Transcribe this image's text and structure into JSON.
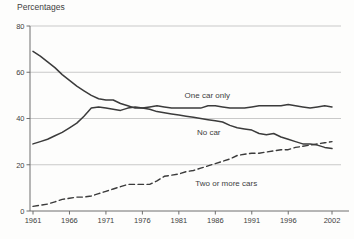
{
  "chart_data": {
    "type": "line",
    "title": "Percentages",
    "xlabel": "",
    "ylabel": "Percentages",
    "xlim": [
      1961,
      2002
    ],
    "ylim": [
      0,
      80
    ],
    "grid": "horizontal",
    "legend_position": "inline-labels",
    "xticks": [
      1961,
      1966,
      1971,
      1976,
      1981,
      1986,
      1991,
      1996,
      2002
    ],
    "xtick_labels": [
      "1961",
      "1966",
      "1971",
      "1976",
      "1981",
      "1986",
      "1991",
      "1996",
      "2002"
    ],
    "yticks": [
      0,
      20,
      40,
      60,
      80
    ],
    "ytick_labels": [
      "0",
      "20",
      "40",
      "60",
      "80"
    ],
    "x": [
      1961,
      1962,
      1963,
      1964,
      1965,
      1966,
      1967,
      1968,
      1969,
      1970,
      1971,
      1972,
      1973,
      1974,
      1975,
      1976,
      1977,
      1978,
      1979,
      1980,
      1981,
      1982,
      1983,
      1984,
      1985,
      1986,
      1987,
      1988,
      1989,
      1990,
      1991,
      1992,
      1993,
      1994,
      1995,
      1996,
      1997,
      1998,
      1999,
      2000,
      2001,
      2002
    ],
    "series": [
      {
        "name": "No car",
        "style": "solid",
        "values": [
          69,
          67,
          64.5,
          62,
          59,
          56.5,
          54,
          52,
          50,
          48.5,
          48,
          48,
          46.5,
          45.5,
          44.5,
          44.5,
          44,
          43,
          42.5,
          42,
          41.5,
          41,
          40.5,
          40,
          39.5,
          39,
          38.5,
          37,
          36,
          35.5,
          35,
          33.5,
          33,
          33.5,
          32,
          31,
          30,
          29,
          29,
          28.5,
          27.5,
          27
        ],
        "label_at": {
          "x": 1985.1,
          "y": 32.9
        }
      },
      {
        "name": "One car only",
        "style": "solid",
        "values": [
          29,
          30,
          31,
          32.5,
          34,
          36,
          38,
          41,
          44.5,
          45,
          44.5,
          44,
          43.5,
          44.5,
          45,
          44.5,
          45,
          45.5,
          45,
          44.5,
          44.5,
          44.5,
          44.5,
          44.5,
          45.5,
          45.5,
          45,
          44.5,
          44.5,
          44.5,
          45,
          45.5,
          45.5,
          45.5,
          45.5,
          46,
          45.5,
          45,
          44.5,
          45,
          45.5,
          45
        ],
        "label_at": {
          "x": 1984.9,
          "y": 48.9
        }
      },
      {
        "name": "Two or more cars",
        "style": "dashed",
        "values": [
          2,
          2.5,
          3,
          4,
          5,
          5.5,
          6,
          6,
          6.5,
          7.5,
          8.5,
          9.5,
          10.5,
          11.5,
          11.5,
          11.5,
          11.5,
          13,
          15,
          15.5,
          16,
          17,
          17.5,
          18.5,
          19.5,
          20.5,
          21.5,
          22.5,
          24,
          24.5,
          25,
          25,
          25.5,
          26,
          26.5,
          26.5,
          27.5,
          28,
          28.5,
          29,
          29.5,
          30
        ],
        "label_at": {
          "x": 1987.5,
          "y": 10.8
        }
      }
    ],
    "colors": {
      "line": "#3b3b3b",
      "grid": "#c9c9c9",
      "axis": "#6e6e6e",
      "text": "#3e3e3e",
      "background": "#fdfdfc"
    }
  }
}
